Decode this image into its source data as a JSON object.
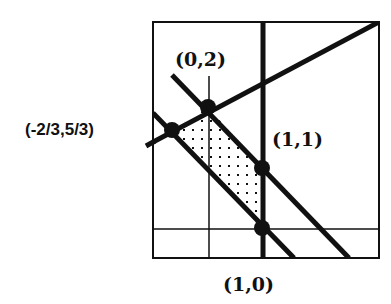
{
  "diagram": {
    "type": "feasible-region-plot",
    "colors": {
      "ink": "#111111",
      "background": "#ffffff"
    },
    "labels": [
      {
        "id": "p02",
        "text": "(0,2)"
      },
      {
        "id": "pm23",
        "text": "(-2/3,5/3)"
      },
      {
        "id": "p11",
        "text": "(1,1)"
      },
      {
        "id": "p10",
        "text": "(1,0)"
      }
    ],
    "vertices": [
      {
        "name": "(0,2)",
        "x": 0,
        "y": 2
      },
      {
        "name": "(-2/3,5/3)",
        "x": -0.6667,
        "y": 1.6667
      },
      {
        "name": "(1,1)",
        "x": 1,
        "y": 1
      },
      {
        "name": "(1,0)",
        "x": 1,
        "y": 0
      }
    ],
    "shaded_region": "dotted quadrilateral between the two parallel diagonal lines, left of x=1 and below the rising line"
  }
}
